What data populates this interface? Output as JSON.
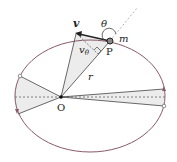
{
  "diagram": {
    "labels": {
      "velocity": "v",
      "angle": "θ",
      "mass": "m",
      "point": "P",
      "tangential_velocity": "vθ",
      "tangential_velocity_base": "v",
      "tangential_velocity_sub": "θ",
      "radius": "r",
      "origin": "O"
    },
    "colors": {
      "orbit": "#8a5a6a",
      "lines": "#444444",
      "shade": "#ececec",
      "dashed": "#666666",
      "dotted": "#aaaaaa"
    }
  }
}
